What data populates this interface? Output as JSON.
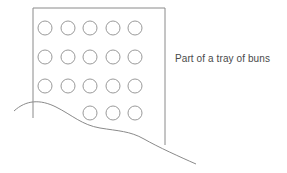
{
  "figure": {
    "title": "Part of a tray of buns",
    "caption": {
      "text": "Part of a tray of buns",
      "x": 175,
      "y": 53,
      "color": "#4a4a4a",
      "font_size": 10
    },
    "canvas": {
      "width": 287,
      "height": 173,
      "background": "#ffffff"
    },
    "style": {
      "line_color": "#8a8a8a",
      "circle_color": "#9a9a9a",
      "line_width": 1
    },
    "tray": {
      "name": "tray-outline",
      "shape": "rectangle",
      "left": 33,
      "top": 8,
      "right": 165,
      "bottom": 145,
      "stroke": "#8a8a8a",
      "fill": "none",
      "path": "M 33 118 L 33 8 L 165 8 L 165 145"
    },
    "buns": {
      "name": "bun-grid",
      "total_visible": 18,
      "radius": 7,
      "columns_x": [
        45,
        68,
        90,
        113,
        135
      ],
      "rows": [
        {
          "row": 1,
          "cy": 28,
          "cx": [
            45,
            68,
            90,
            113,
            135
          ],
          "count": 5
        },
        {
          "row": 2,
          "cy": 57,
          "cx": [
            45,
            68,
            90,
            113,
            135
          ],
          "count": 5
        },
        {
          "row": 3,
          "cy": 86,
          "cx": [
            45,
            68,
            90,
            113,
            135
          ],
          "count": 5
        },
        {
          "row": 4,
          "cy": 113,
          "cx": [
            90,
            113,
            135
          ],
          "count": 3
        }
      ]
    },
    "surface_curve": {
      "name": "surface-edge-curve",
      "description": "wavy line crossing the tray",
      "start": [
        14,
        111
      ],
      "end": [
        196,
        164
      ],
      "path": "M 14 111 C 26 100 40 99 56 107 C 72 115 82 125 100 128 C 118 131 130 131 144 139 C 158 147 180 157 196 164"
    }
  }
}
